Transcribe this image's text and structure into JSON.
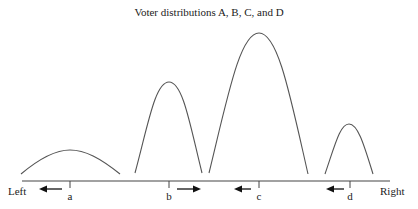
{
  "title": "Voter distributions A, B, C, and D",
  "axis": {
    "left_label": "Left",
    "right_label": "Right"
  },
  "ticks": [
    {
      "label": "a",
      "arrow_direction": "left"
    },
    {
      "label": "b",
      "arrow_direction": "right"
    },
    {
      "label": "c",
      "arrow_direction": "left"
    },
    {
      "label": "d",
      "arrow_direction": "left"
    }
  ],
  "distributions": [
    {
      "name": "A",
      "peak_position": "a",
      "relative_height": "low, wide"
    },
    {
      "name": "B",
      "peak_position": "b",
      "relative_height": "tall, narrow"
    },
    {
      "name": "C",
      "peak_position": "c",
      "relative_height": "tallest"
    },
    {
      "name": "D",
      "peak_position": "d",
      "relative_height": "short, narrow"
    }
  ]
}
